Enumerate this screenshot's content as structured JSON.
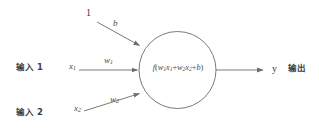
{
  "diagram": {
    "background_color": "#ffffff",
    "stroke_color": "#6b6b6b",
    "text_color": "#4a4a4a"
  },
  "bias": {
    "source_label": "1",
    "weight_label": "b"
  },
  "inputs": [
    {
      "group_label": "输入 1",
      "variable": "x",
      "variable_subscript": "1",
      "weight": "w",
      "weight_subscript": "1"
    },
    {
      "group_label": "输入 2",
      "variable": "x",
      "variable_subscript": "2",
      "weight": "w",
      "weight_subscript": "2"
    }
  ],
  "neuron": {
    "function_name": "f",
    "open_paren": "(",
    "term1_w": "w",
    "term1_w_sub": "1",
    "term1_x": "x",
    "term1_x_sub": "1",
    "plus1": "+",
    "term2_w": "w",
    "term2_w_sub": "2",
    "term2_x": "x",
    "term2_x_sub": "2",
    "plus2": "+",
    "bias_term": "b",
    "close_paren": ")",
    "formula_plain": "f(w1x1+w2x2+b)"
  },
  "output": {
    "variable": "y",
    "group_label": "输出"
  }
}
